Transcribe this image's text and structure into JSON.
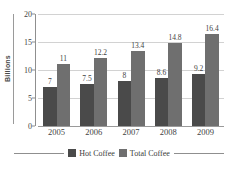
{
  "chart_data": {
    "type": "bar",
    "title": "",
    "xlabel": "",
    "ylabel": "Billions",
    "categories": [
      "2005",
      "2006",
      "2007",
      "2008",
      "2009"
    ],
    "series": [
      {
        "name": "Hot Coffee",
        "color": "#4a4a4a",
        "values": [
          7,
          7.5,
          8,
          8.6,
          9.2
        ]
      },
      {
        "name": "Total Coffee",
        "color": "#6f6f6f",
        "values": [
          11,
          12.2,
          13.4,
          14.8,
          16.4
        ]
      }
    ],
    "data_labels": [
      [
        "7",
        "11"
      ],
      [
        "7.5",
        "12.2"
      ],
      [
        "8",
        "13.4"
      ],
      [
        "8.6",
        "14.8"
      ],
      [
        "9.2",
        "16.4"
      ]
    ],
    "ylim": [
      0,
      20
    ],
    "yticks": [
      0,
      5,
      10,
      15,
      20
    ],
    "ytick_labels": [
      "0",
      "5",
      "10",
      "15",
      "20"
    ],
    "grid": true,
    "legend_position": "bottom"
  }
}
